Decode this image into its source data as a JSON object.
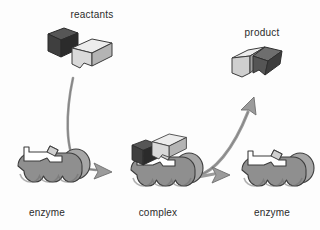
{
  "diagram": {
    "background_color": "#fdfdfd",
    "labels": {
      "reactants": "reactants",
      "product": "product",
      "enzyme_left": "enzyme",
      "complex": "complex",
      "enzyme_right": "enzyme"
    },
    "colors": {
      "enzyme_body": "#8f8f8f",
      "enzyme_body_shade": "#7b7b7b",
      "enzyme_highlight": "#a6a6a6",
      "outline": "#3c3c3c",
      "reactant_dark": "#3f3f3f",
      "reactant_dark_side": "#2b2b2b",
      "reactant_dark_top": "#565656",
      "reactant_light": "#d9d9d9",
      "reactant_light_side": "#b4b4b4",
      "reactant_light_top": "#ececec",
      "arrow_fill": "#9b9b9b",
      "arrow_outline": "#6e6e6e",
      "text": "#2b2b2b"
    },
    "stages": [
      {
        "name": "reactants",
        "label": "reactants",
        "description": "two free substrate molecules, one dark cube and one light notched wedge"
      },
      {
        "name": "enzyme-free-left",
        "label": "enzyme",
        "description": "free enzyme with empty active site"
      },
      {
        "name": "enzyme-substrate-complex",
        "label": "complex",
        "description": "enzyme with both substrates bound in the active site"
      },
      {
        "name": "product",
        "label": "product",
        "description": "the two substrates joined into a single product molecule"
      },
      {
        "name": "enzyme-free-right",
        "label": "enzyme",
        "description": "regenerated free enzyme, unchanged"
      }
    ],
    "arrows": [
      {
        "name": "reactants-to-complex",
        "from": "reactants",
        "to": "complex",
        "style": "curved-down-right"
      },
      {
        "name": "complex-to-product",
        "from": "complex",
        "to": "product",
        "style": "curved-up-right"
      },
      {
        "name": "complex-to-enzyme",
        "from": "complex",
        "to": "enzyme_right",
        "style": "straight-right"
      }
    ]
  }
}
